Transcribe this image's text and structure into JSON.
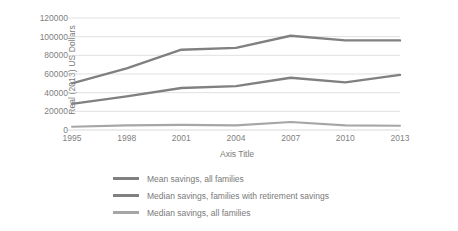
{
  "chart_data": {
    "type": "line",
    "title": "",
    "xlabel": "Axis Title",
    "ylabel": "Real (2013) US Dollars",
    "categories": [
      "1995",
      "1998",
      "2001",
      "2004",
      "2007",
      "2010",
      "2013"
    ],
    "ylim": [
      0,
      120000
    ],
    "ytick_step": 20000,
    "yticks": [
      "0",
      "20000",
      "40000",
      "60000",
      "80000",
      "100000",
      "120000"
    ],
    "grid": true,
    "legend_position": "bottom",
    "series": [
      {
        "name": "Mean savings, all families",
        "color": "#808080",
        "values": [
          50000,
          66000,
          86000,
          88000,
          101000,
          96000,
          96000
        ]
      },
      {
        "name": "Median savings, families with retirement savings",
        "color": "#808080",
        "values": [
          28000,
          36000,
          45000,
          47000,
          56000,
          51000,
          59000
        ]
      },
      {
        "name": "Median savings, all families",
        "color": "#a6a6a6",
        "values": [
          3500,
          5000,
          5500,
          5000,
          8500,
          5000,
          4500
        ]
      }
    ]
  },
  "axes": {
    "y_title": "Real (2013) US Dollars",
    "x_title": "Axis Title"
  },
  "legend": {
    "items": [
      {
        "label": "Mean savings, all families",
        "color": "#808080"
      },
      {
        "label": "Median savings, families with retirement savings",
        "color": "#808080"
      },
      {
        "label": "Median savings, all families",
        "color": "#a6a6a6"
      }
    ]
  },
  "style": {
    "grid_color": "#d9d9d9",
    "text_color": "#7a7a7a",
    "background": "#ffffff"
  }
}
